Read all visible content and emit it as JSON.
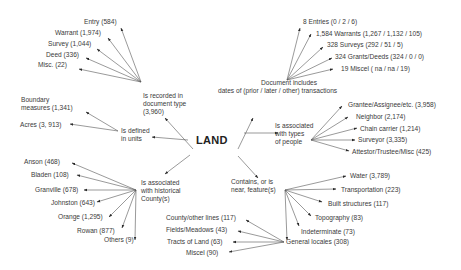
{
  "center": {
    "label": "LAND"
  },
  "hubs": {
    "document_type": {
      "label_lines": [
        "Is recorded in",
        "document type",
        "(3,960)"
      ]
    },
    "dates": {
      "label_lines": [
        "Document includes",
        "dates of (prior / later / other) transactions"
      ]
    },
    "units": {
      "label_lines": [
        "Is defined",
        "in units"
      ]
    },
    "people": {
      "label_lines": [
        "Is associated",
        "with types",
        "of people"
      ]
    },
    "county": {
      "label_lines": [
        "Is associated",
        "with historical",
        "County(s)"
      ]
    },
    "features": {
      "label_lines": [
        "Contains, or is",
        "near, feature(s)"
      ]
    },
    "general_locales": {
      "label": "General locales (308)"
    }
  },
  "leaves": {
    "document_type": [
      "Entry (584)",
      "Warrant (1,974)",
      "Survey (1,044)",
      "Deed (336)",
      "Misc. (22)"
    ],
    "dates": [
      "8 Entries (0 / 2 / 6)",
      "1,584 Warrants (1,267 / 1,132 / 105)",
      "328 Surveys (292 / 51 / 5)",
      "324 Grants/Deeds (324 / 0 / 0)",
      "19 Miscel ( na / na / 19)"
    ],
    "units": [
      "Boundary",
      "measures (1,341)",
      "Acres (3, 913)"
    ],
    "people": [
      "Grantee/Assignee/etc. (3,958)",
      "Neighbor (2,174)",
      "Chain carrier (1,214)",
      "Surveyor (3,335)",
      "Attestor/Trustee/Misc (425)"
    ],
    "county": [
      "Anson (468)",
      "Bladen (108)",
      "Granville (678)",
      "Johnston (643)",
      "Orange (1,295)",
      "Rowan (877)",
      "Others (9)"
    ],
    "features": [
      "Water (3,789)",
      "Transportation (223)",
      "Built structures (117)",
      "Topography (83)",
      "Indeterminate (73)"
    ],
    "general_locales": [
      "County/other lines (117)",
      "Fields/Meadows (43)",
      "Tracts of Land (63)",
      "Miscel (90)"
    ]
  },
  "colors": {
    "text": "#3a3a3a",
    "arrow": "#2a2a2a",
    "background": "#ffffff"
  }
}
